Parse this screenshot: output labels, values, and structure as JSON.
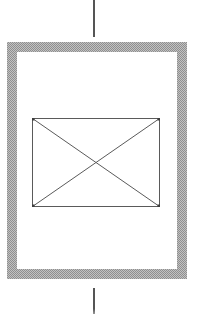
{
  "diagram": {
    "type": "schematic-figure",
    "colors": {
      "background": "#ffffff",
      "interior": "#ffffff",
      "frame_dot_dark": "#8f8f8f",
      "frame_dot_light": "#c2c2c2",
      "lead_line": "#555555",
      "placeholder_stroke": "#5a5a5a",
      "placeholder_corner": "#3f3f3f"
    },
    "elements": [
      {
        "name": "top-lead-line",
        "shape": "vertical-line"
      },
      {
        "name": "outer-frame",
        "shape": "rectangle",
        "border_style": "stippled-halftone"
      },
      {
        "name": "placeholder-box",
        "shape": "rectangle-with-x-diagonals"
      },
      {
        "name": "bottom-lead-line",
        "shape": "vertical-line"
      }
    ]
  }
}
